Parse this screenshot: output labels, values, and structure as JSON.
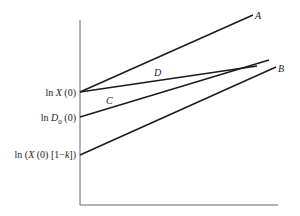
{
  "diagram": {
    "y_axis_labels": {
      "lnX0": {
        "prefix": "ln ",
        "var": "X",
        "suffix": " (0)"
      },
      "lnD0": {
        "prefix": "ln ",
        "var": "D",
        "sub": "0",
        "suffix": " (0)"
      },
      "lnXk": {
        "prefix": "ln (",
        "var": "X",
        "mid": " (0) [1−",
        "var2": "k",
        "suffix": "])"
      }
    },
    "line_labels": {
      "A": "A",
      "B": "B",
      "C": "C",
      "D": "D"
    },
    "colors": {
      "line": "#1a1a1a",
      "axis": "#555555",
      "text": "#222222"
    }
  }
}
